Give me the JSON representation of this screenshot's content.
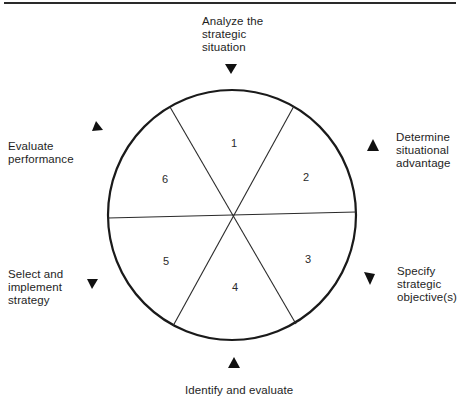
{
  "diagram": {
    "type": "cycle",
    "segments": [
      {
        "number": "1",
        "label": "Analyze the\nstrategic\nsituation"
      },
      {
        "number": "2",
        "label": "Determine\nsituational\nadvantage"
      },
      {
        "number": "3",
        "label": "Specify\nstrategic\nobjective(s)"
      },
      {
        "number": "4",
        "label": "Identify and evaluate"
      },
      {
        "number": "5",
        "label": "Select and\nimplement\nstrategy"
      },
      {
        "number": "6",
        "label": "Evaluate\nperformance"
      }
    ],
    "colors": {
      "line": "#1a1a1a",
      "background": "#ffffff"
    }
  }
}
